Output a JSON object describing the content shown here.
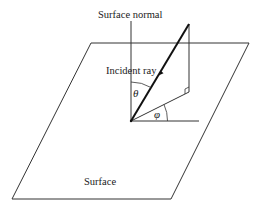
{
  "diagram": {
    "labels": {
      "surface_normal": "Surface normal",
      "incident_ray": "Incident ray",
      "theta": "θ",
      "phi": "φ",
      "surface": "Surface"
    },
    "colors": {
      "line": "#333333",
      "ray": "#111111",
      "background": "#ffffff"
    }
  }
}
